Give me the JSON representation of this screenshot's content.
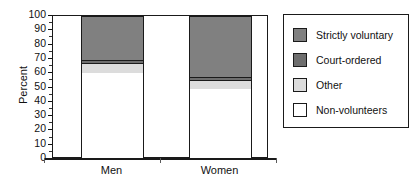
{
  "chart_data": {
    "type": "bar",
    "subtype": "stacked-100-percent",
    "title": "",
    "xlabel": "",
    "ylabel": "Percent",
    "ylim": [
      0,
      100
    ],
    "ytick_step": 10,
    "ytick_labels": [
      "100",
      "90",
      "80",
      "70",
      "60",
      "50",
      "40",
      "30",
      "20",
      "10",
      "0"
    ],
    "grid": false,
    "legend_position": "right",
    "categories": [
      "Men",
      "Women"
    ],
    "series": [
      {
        "name": "Strictly voluntary",
        "color": "#808080",
        "values": [
          31,
          43
        ]
      },
      {
        "name": "Court-ordered",
        "color": "#6e6e6e",
        "values": [
          2,
          2
        ]
      },
      {
        "name": "Other",
        "color": "#dcdcdc",
        "values": [
          7,
          6
        ]
      },
      {
        "name": "Non-volunteers",
        "color": "#ffffff",
        "values": [
          60,
          49
        ]
      }
    ],
    "stack_order_bottom_to_top": [
      "Non-volunteers",
      "Other",
      "Court-ordered",
      "Strictly voluntary"
    ],
    "boundaries_percent": {
      "Men": [
        0,
        60,
        67,
        69,
        100
      ],
      "Women": [
        0,
        49,
        55,
        57,
        100
      ]
    }
  },
  "legend": {
    "items": [
      {
        "label": "Strictly voluntary",
        "color": "#808080"
      },
      {
        "label": "Court-ordered",
        "color": "#6e6e6e"
      },
      {
        "label": "Other",
        "color": "#dcdcdc"
      },
      {
        "label": "Non-volunteers",
        "color": "#ffffff"
      }
    ]
  },
  "colors": {
    "axis": "#1a1a1a",
    "text": "#111111",
    "background": "#ffffff"
  }
}
